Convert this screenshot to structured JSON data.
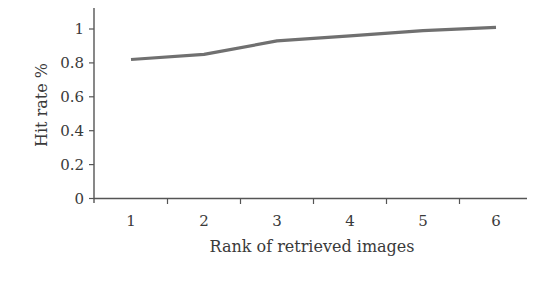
{
  "chart_data": {
    "type": "line",
    "title": "",
    "xlabel": "Rank of retrieved images",
    "ylabel": "Hit rate %",
    "x": [
      1,
      2,
      3,
      4,
      5,
      6
    ],
    "categories": [
      "1",
      "2",
      "3",
      "4",
      "5",
      "6"
    ],
    "series": [
      {
        "name": "Hit rate",
        "values": [
          0.82,
          0.85,
          0.93,
          0.96,
          0.99,
          1.01
        ],
        "color": "#707070"
      }
    ],
    "yticks": [
      "0",
      "0.2",
      "0.4",
      "0.6",
      "0.8",
      "1"
    ],
    "ytick_values": [
      0,
      0.2,
      0.4,
      0.6,
      0.8,
      1.0
    ],
    "xticks": [
      "1",
      "2",
      "3",
      "4",
      "5",
      "6"
    ],
    "ylim": [
      0,
      1.12
    ],
    "xlim": [
      0.5,
      6.45
    ],
    "grid": false,
    "legend": null
  },
  "layout": {
    "axis_color": "#555555",
    "text_color": "#3a3a3a"
  }
}
